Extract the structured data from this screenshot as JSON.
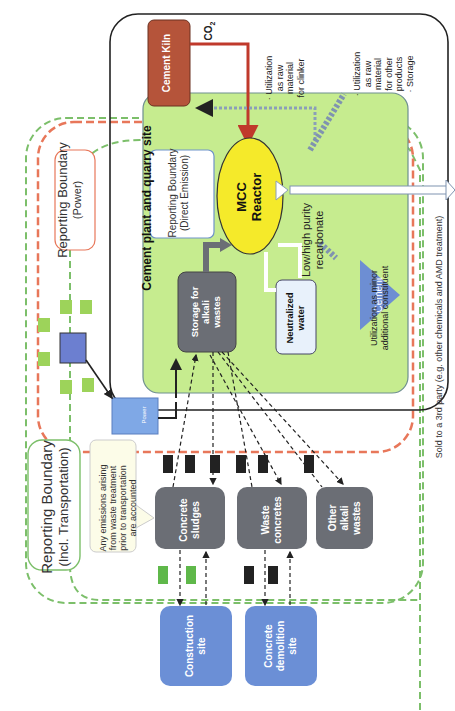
{
  "diagram": {
    "orientation": "rotated -90deg",
    "boundaries": {
      "transportation": {
        "label": "Reporting Boundary",
        "sublabel": "(Incl. Transportation)",
        "color": "#7cbf6a"
      },
      "power": {
        "label": "Reporting Boundary",
        "sublabel": "(Power)",
        "color": "#e8775a"
      },
      "direct_emission": {
        "label": "Reporting Boundary",
        "sublabel": "(Direct Emission)",
        "color": "#6f93c9"
      }
    },
    "site": {
      "label": "Cement plant and quarry site"
    },
    "note": {
      "lines": [
        "Any emissions arising",
        "from waste treatment",
        "prior to transportation",
        "are accounted"
      ]
    },
    "sources": [
      {
        "id": "construction",
        "lines": [
          "Construction",
          "site"
        ]
      },
      {
        "id": "demolition",
        "lines": [
          "Concrete",
          "demolition",
          "site"
        ]
      }
    ],
    "wastes": [
      {
        "id": "sludges",
        "lines": [
          "Concrete",
          "sludges"
        ]
      },
      {
        "id": "waste_concretes",
        "lines": [
          "Waste",
          "concretes"
        ]
      },
      {
        "id": "other",
        "lines": [
          "Other",
          "alkali",
          "wastes"
        ]
      }
    ],
    "storage": {
      "lines": [
        "Storage for",
        "alkali",
        "wastes"
      ]
    },
    "kiln": {
      "label": "Cement Kiln"
    },
    "co2": {
      "label": "CO",
      "sub": "2"
    },
    "reactor": {
      "lines": [
        "MCC",
        "Reactor"
      ]
    },
    "water": {
      "lines": [
        "Neutralized",
        "water"
      ]
    },
    "cement": {
      "label": "Cement"
    },
    "power_icon": {
      "label": "Power"
    },
    "product": {
      "lines": [
        "Low/high purity",
        "recarbonate"
      ]
    },
    "uses": {
      "clinker": {
        "lines": [
          "· Utilization",
          "as raw",
          "material",
          "for clinker"
        ]
      },
      "other_products": {
        "lines": [
          "· Utilization",
          "as raw",
          "material",
          "for other",
          "products",
          "· Storage"
        ]
      },
      "minor": {
        "lines": [
          "Utilization as minor",
          "additional constituent"
        ]
      }
    },
    "third_party": {
      "label": "Sold to a 3rd party  (e.g. other chemicals and AMD treatment)"
    },
    "colors": {
      "green_fill": "#c6ec8f",
      "gray_box": "#6b6e75",
      "blue_box": "#6b8fd6",
      "kiln": "#b5543a",
      "reactor": "#f5ea2a",
      "water_box": "#e8f1fb",
      "cement": "#6d8ed3"
    }
  }
}
